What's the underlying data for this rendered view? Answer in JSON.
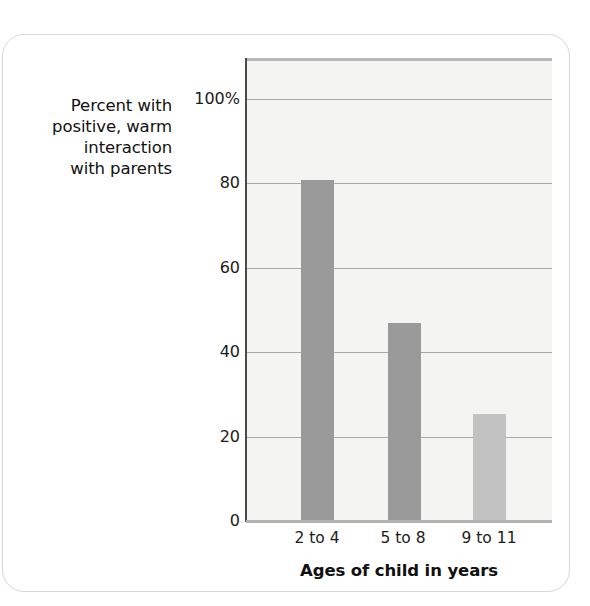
{
  "chart_data": {
    "type": "bar",
    "title": "",
    "subtitle": "",
    "categories": [
      "2 to 4",
      "5 to 8",
      "9 to 11"
    ],
    "values": [
      81,
      47,
      25.5
    ],
    "series": [
      {
        "name": "Percent with positive, warm interaction with parents",
        "values": [
          81,
          47,
          25.5
        ]
      }
    ],
    "xlabel": "Ages of child in years",
    "ylabel": "Percent with positive, warm interaction with parents",
    "ylim": [
      0,
      110
    ],
    "yticks": [
      0,
      20,
      40,
      60,
      80,
      100
    ],
    "ytick_labels": [
      "0",
      "20",
      "40",
      "60",
      "80",
      "100%"
    ],
    "grid": true,
    "grid_axis": "y",
    "legend": false,
    "legend_position": "none",
    "bar_colors": [
      "#9a9a9a",
      "#9a9a9a",
      "#c2c2c2"
    ],
    "plot_background": "#f4f4f3"
  },
  "axes": {
    "y_caption_lines": [
      "Percent with",
      "positive, warm",
      "interaction",
      "with parents"
    ],
    "y_tick_labels": [
      "100%",
      "80",
      "60",
      "40",
      "20",
      "0"
    ],
    "x_tick_labels": [
      "2 to 4",
      "5 to 8",
      "9 to 11"
    ],
    "x_axis_title": "Ages of child in years"
  },
  "colors": {
    "bar_dark": "#9a9a9a",
    "bar_light": "#c2c2c2",
    "plot_fill": "#f4f4f3",
    "gridline": "#a9a9a9",
    "axis_line": "#4a4a4a",
    "card_border": "#d7d7d7",
    "text": "#111111"
  }
}
